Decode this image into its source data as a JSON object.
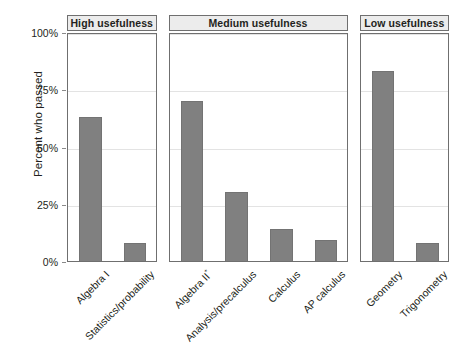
{
  "chart_data": {
    "type": "bar",
    "title": "",
    "subtitle": "",
    "xlabel": "",
    "ylabel": "Percent who passed",
    "ylim": [
      0,
      100
    ],
    "grid": true,
    "legend": "none",
    "y_ticks": [
      "0%",
      "25%",
      "50%",
      "75%",
      "100%"
    ],
    "y_tick_values": [
      0,
      25,
      50,
      75,
      100
    ],
    "facet_layout": "horizontal",
    "bar_color": "#808080",
    "bar_edge_color": "#737373",
    "panel_header_bg": "#ececec",
    "panel_border_color": "#6f6f6f",
    "gridline_color": "#e3e3e3",
    "panels": [
      {
        "title": "High usefulness",
        "categories": [
          "Algebra I",
          "Statistics/probability"
        ],
        "values": [
          63,
          8
        ]
      },
      {
        "title": "Medium usefulness",
        "categories": [
          "Algebra II*",
          "Analysis/precalculus",
          "Calculus",
          "AP calculus"
        ],
        "values": [
          70,
          30,
          14,
          9
        ]
      },
      {
        "title": "Low usefulness",
        "categories": [
          "Geometry",
          "Trigonometry"
        ],
        "values": [
          83,
          8
        ]
      }
    ]
  }
}
